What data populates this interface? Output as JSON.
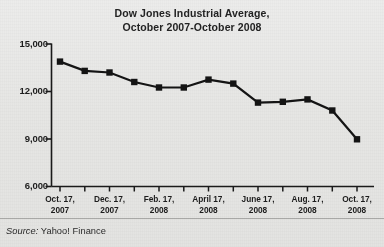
{
  "figure": {
    "title_line1": "Dow Jones Industrial Average,",
    "title_line2": "October 2007-October 2008",
    "source_prefix": "Source:",
    "source_text": " Yahoo! Finance",
    "background_color": "#e7e7e5",
    "ink_color": "#1a1a1a"
  },
  "chart_data": {
    "type": "line",
    "title": "Dow Jones Industrial Average, October 2007-October 2008",
    "xlabel": "",
    "ylabel": "",
    "ylim": [
      6000,
      15000
    ],
    "yticks": [
      6000,
      9000,
      12000,
      15000
    ],
    "ytick_labels": [
      "6,000",
      "9,000",
      "12,000",
      "15,000"
    ],
    "grid": false,
    "legend": "none",
    "marker": "square",
    "line_color": "#141414",
    "marker_color": "#141414",
    "x": [
      "Oct. 17, 2007",
      "Nov. 17, 2007",
      "Dec. 17, 2007",
      "Jan. 17, 2008",
      "Feb. 17, 2008",
      "Mar. 17, 2008",
      "April 17, 2008",
      "May 17, 2008",
      "June 17, 2008",
      "July 17, 2008",
      "Aug. 17, 2008",
      "Sept. 17, 2008",
      "Oct. 17, 2008"
    ],
    "values": [
      13890,
      13300,
      13200,
      12600,
      12250,
      12250,
      12750,
      12500,
      11300,
      11350,
      11500,
      10800,
      8980
    ],
    "xtick_labels": [
      {
        "month": "Oct. 17,",
        "year": "2007"
      },
      {
        "month": "Dec. 17,",
        "year": "2007"
      },
      {
        "month": "Feb. 17,",
        "year": "2008"
      },
      {
        "month": "April 17,",
        "year": "2008"
      },
      {
        "month": "June 17,",
        "year": "2008"
      },
      {
        "month": "Aug. 17,",
        "year": "2008"
      },
      {
        "month": "Oct. 17,",
        "year": "2008"
      }
    ],
    "xtick_indices": [
      0,
      2,
      4,
      6,
      8,
      10,
      12
    ]
  }
}
